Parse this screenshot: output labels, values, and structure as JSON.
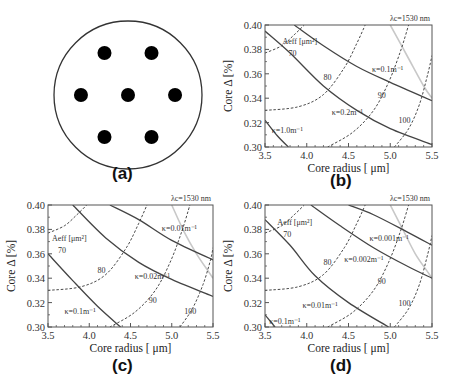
{
  "figure": {
    "panel_labels": [
      "(a)",
      "(b)",
      "(c)",
      "(d)"
    ]
  },
  "schematic": {
    "label": "(a)",
    "description": "7-core fiber cross-section",
    "cores": [
      {
        "x": -1,
        "y": -1
      },
      {
        "x": 1,
        "y": -1
      },
      {
        "x": -2,
        "y": 0
      },
      {
        "x": 0,
        "y": 0
      },
      {
        "x": 2,
        "y": 0
      },
      {
        "x": -1,
        "y": 1
      },
      {
        "x": 1,
        "y": 1
      }
    ]
  },
  "chart_data": [
    {
      "panel": "(b)",
      "type": "line",
      "xlabel": "Core radius [ μm]",
      "ylabel": "Core  Δ [%]",
      "xlim": [
        3.5,
        5.5
      ],
      "ylim": [
        0.3,
        0.4
      ],
      "xticks": [
        "3.5",
        "4.0",
        "4.5",
        "5.0",
        "5.5"
      ],
      "yticks": [
        "0.30",
        "0.32",
        "0.34",
        "0.36",
        "0.38",
        "0.40"
      ],
      "cutoff_label": "λc=1530 nm",
      "aeff_title": "Aeff [μm²]",
      "cutoff_curve": {
        "name": "λc=1530 nm",
        "style": "gray",
        "points": [
          [
            5.0,
            0.4
          ],
          [
            5.2,
            0.375
          ],
          [
            5.4,
            0.35
          ],
          [
            5.5,
            0.34
          ]
        ]
      },
      "aeff_curves": [
        {
          "label": "70",
          "points": [
            [
              3.5,
              0.377
            ],
            [
              3.7,
              0.383
            ],
            [
              3.85,
              0.392
            ],
            [
              3.97,
              0.4
            ]
          ],
          "lx": 3.78,
          "ly": 0.377
        },
        {
          "label": "80",
          "points": [
            [
              3.5,
              0.33
            ],
            [
              3.9,
              0.333
            ],
            [
              4.2,
              0.343
            ],
            [
              4.45,
              0.365
            ],
            [
              4.6,
              0.385
            ],
            [
              4.7,
              0.4
            ]
          ],
          "lx": 4.2,
          "ly": 0.357
        },
        {
          "label": "90",
          "points": [
            [
              4.25,
              0.3
            ],
            [
              4.55,
              0.312
            ],
            [
              4.8,
              0.33
            ],
            [
              4.98,
              0.353
            ],
            [
              5.12,
              0.378
            ],
            [
              5.22,
              0.4
            ]
          ],
          "lx": 4.85,
          "ly": 0.343
        },
        {
          "label": "100",
          "points": [
            [
              5.05,
              0.3
            ],
            [
              5.22,
              0.315
            ],
            [
              5.35,
              0.335
            ],
            [
              5.45,
              0.36
            ],
            [
              5.5,
              0.375
            ]
          ],
          "lx": 5.1,
          "ly": 0.322
        }
      ],
      "kappa_curves": [
        {
          "label": "κ=0.1m⁻¹",
          "points": [
            [
              3.85,
              0.4
            ],
            [
              4.2,
              0.383
            ],
            [
              4.6,
              0.366
            ],
            [
              5.0,
              0.353
            ],
            [
              5.5,
              0.338
            ]
          ],
          "lx": 4.78,
          "ly": 0.364
        },
        {
          "label": "κ=0.2m⁻¹",
          "points": [
            [
              3.5,
              0.395
            ],
            [
              3.8,
              0.377
            ],
            [
              4.2,
              0.35
            ],
            [
              4.6,
              0.33
            ],
            [
              5.0,
              0.315
            ],
            [
              5.5,
              0.302
            ]
          ],
          "lx": 4.3,
          "ly": 0.329
        },
        {
          "label": "κ=1.0m⁻¹",
          "points": [
            [
              3.5,
              0.322
            ],
            [
              3.65,
              0.309
            ],
            [
              3.78,
              0.3
            ]
          ],
          "lx": 3.58,
          "ly": 0.314
        }
      ]
    },
    {
      "panel": "(c)",
      "type": "line",
      "xlabel": "Core radius [ μm]",
      "ylabel": "Core  Δ [%]",
      "xlim": [
        3.5,
        5.5
      ],
      "ylim": [
        0.3,
        0.4
      ],
      "xticks": [
        "3.5",
        "4.0",
        "4.5",
        "5.0",
        "5.5"
      ],
      "yticks": [
        "0.30",
        "0.32",
        "0.34",
        "0.36",
        "0.38",
        "0.40"
      ],
      "cutoff_label": "λc=1530 nm",
      "aeff_title": "Aeff [μm²]",
      "cutoff_curve": {
        "name": "λc=1530 nm",
        "style": "gray",
        "points": [
          [
            5.0,
            0.4
          ],
          [
            5.15,
            0.378
          ],
          [
            5.3,
            0.36
          ],
          [
            5.45,
            0.345
          ],
          [
            5.5,
            0.34
          ]
        ]
      },
      "aeff_curves": [
        {
          "label": "70",
          "points": [
            [
              3.5,
              0.377
            ],
            [
              3.7,
              0.383
            ],
            [
              3.85,
              0.392
            ],
            [
              3.97,
              0.4
            ]
          ],
          "lx": 3.62,
          "ly": 0.363
        },
        {
          "label": "80",
          "points": [
            [
              3.5,
              0.33
            ],
            [
              3.9,
              0.333
            ],
            [
              4.2,
              0.343
            ],
            [
              4.45,
              0.365
            ],
            [
              4.6,
              0.385
            ],
            [
              4.7,
              0.4
            ]
          ],
          "lx": 4.1,
          "ly": 0.347
        },
        {
          "label": "90",
          "points": [
            [
              4.25,
              0.3
            ],
            [
              4.55,
              0.312
            ],
            [
              4.8,
              0.33
            ],
            [
              4.98,
              0.353
            ],
            [
              5.12,
              0.378
            ],
            [
              5.22,
              0.4
            ]
          ],
          "lx": 4.72,
          "ly": 0.322
        },
        {
          "label": "100",
          "points": [
            [
              5.1,
              0.3
            ],
            [
              5.25,
              0.315
            ],
            [
              5.38,
              0.335
            ],
            [
              5.47,
              0.355
            ],
            [
              5.5,
              0.365
            ]
          ],
          "lx": 5.15,
          "ly": 0.313
        }
      ],
      "kappa_curves": [
        {
          "label": "κ=0.01m⁻¹",
          "points": [
            [
              4.25,
              0.4
            ],
            [
              4.6,
              0.388
            ],
            [
              5.0,
              0.371
            ],
            [
              5.5,
              0.355
            ]
          ],
          "lx": 4.88,
          "ly": 0.381
        },
        {
          "label": "κ=0.02m⁻¹",
          "points": [
            [
              3.8,
              0.4
            ],
            [
              4.2,
              0.373
            ],
            [
              4.6,
              0.353
            ],
            [
              5.0,
              0.339
            ],
            [
              5.5,
              0.325
            ]
          ],
          "lx": 4.55,
          "ly": 0.342
        },
        {
          "label": "κ=0.1m⁻¹",
          "points": [
            [
              3.5,
              0.36
            ],
            [
              3.8,
              0.338
            ],
            [
              4.1,
              0.317
            ],
            [
              4.38,
              0.3
            ]
          ],
          "lx": 3.7,
          "ly": 0.313
        }
      ]
    },
    {
      "panel": "(d)",
      "type": "line",
      "xlabel": "Core radius [ μm]",
      "ylabel": "Core  Δ [%]",
      "xlim": [
        3.5,
        5.5
      ],
      "ylim": [
        0.3,
        0.4
      ],
      "xticks": [
        "3.5",
        "4.0",
        "4.5",
        "5.0",
        "5.5"
      ],
      "yticks": [
        "0.30",
        "0.32",
        "0.34",
        "0.36",
        "0.38",
        "0.40"
      ],
      "cutoff_label": "λc=1530 nm",
      "aeff_title": "Aeff [μm²]",
      "cutoff_curve": {
        "name": "λc=1530 nm",
        "style": "gray",
        "points": [
          [
            5.0,
            0.4
          ],
          [
            5.15,
            0.38
          ],
          [
            5.3,
            0.36
          ],
          [
            5.45,
            0.345
          ],
          [
            5.5,
            0.34
          ]
        ]
      },
      "aeff_curves": [
        {
          "label": "70",
          "points": [
            [
              3.5,
              0.377
            ],
            [
              3.7,
              0.383
            ],
            [
              3.85,
              0.392
            ],
            [
              3.97,
              0.4
            ]
          ],
          "lx": 3.72,
          "ly": 0.376
        },
        {
          "label": "80",
          "points": [
            [
              3.5,
              0.33
            ],
            [
              3.9,
              0.333
            ],
            [
              4.2,
              0.343
            ],
            [
              4.45,
              0.365
            ],
            [
              4.6,
              0.385
            ],
            [
              4.7,
              0.4
            ]
          ],
          "lx": 4.2,
          "ly": 0.353
        },
        {
          "label": "90",
          "points": [
            [
              4.25,
              0.3
            ],
            [
              4.55,
              0.312
            ],
            [
              4.8,
              0.33
            ],
            [
              4.98,
              0.353
            ],
            [
              5.12,
              0.378
            ],
            [
              5.22,
              0.4
            ]
          ],
          "lx": 4.85,
          "ly": 0.338
        },
        {
          "label": "100",
          "points": [
            [
              5.05,
              0.3
            ],
            [
              5.22,
              0.315
            ],
            [
              5.35,
              0.335
            ],
            [
              5.45,
              0.36
            ],
            [
              5.5,
              0.375
            ]
          ],
          "lx": 5.1,
          "ly": 0.32
        }
      ],
      "kappa_curves": [
        {
          "label": "κ=0.001m⁻¹",
          "points": [
            [
              4.5,
              0.4
            ],
            [
              4.8,
              0.392
            ],
            [
              5.2,
              0.378
            ],
            [
              5.5,
              0.367
            ]
          ],
          "lx": 4.75,
          "ly": 0.373
        },
        {
          "label": "κ=0.002m⁻¹",
          "points": [
            [
              4.05,
              0.4
            ],
            [
              4.4,
              0.383
            ],
            [
              4.8,
              0.365
            ],
            [
              5.2,
              0.35
            ],
            [
              5.5,
              0.34
            ]
          ],
          "lx": 4.45,
          "ly": 0.356
        },
        {
          "label": "κ=0.01m⁻¹",
          "points": [
            [
              3.5,
              0.388
            ],
            [
              3.8,
              0.367
            ],
            [
              4.1,
              0.342
            ],
            [
              4.5,
              0.32
            ],
            [
              4.98,
              0.3
            ]
          ],
          "lx": 3.95,
          "ly": 0.318
        },
        {
          "label": "κ=0.1m⁻¹",
          "points": [
            [
              3.5,
              0.31
            ],
            [
              3.62,
              0.3
            ]
          ],
          "lx": 3.55,
          "ly": 0.305
        }
      ]
    }
  ]
}
